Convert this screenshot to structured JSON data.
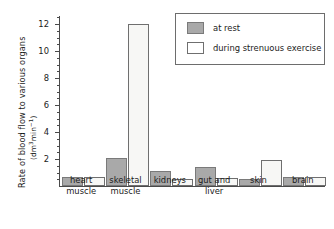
{
  "chart_data": {
    "type": "bar",
    "title": "",
    "xlabel": "",
    "ylabel": "Rate of blood flow to various organs",
    "yunit": "(dm3 min-1)",
    "ylim": [
      0,
      12.6
    ],
    "ytick_values": [
      2,
      4,
      6,
      8,
      10,
      12
    ],
    "ytick_labels": [
      "2",
      "4",
      "6",
      "8",
      "10",
      "12"
    ],
    "yminor_step": 0.5,
    "grid": false,
    "legend_position": "top-right",
    "categories": [
      "heart muscle",
      "skeletal muscle",
      "kidneys",
      "gut and liver",
      "skin",
      "brain"
    ],
    "category_lines": [
      [
        "heart",
        "muscle"
      ],
      [
        "skeletal",
        "muscle"
      ],
      [
        "kidneys",
        ""
      ],
      [
        "gut and",
        "liver"
      ],
      [
        "skin",
        ""
      ],
      [
        "brain",
        ""
      ]
    ],
    "series": [
      {
        "name": "at rest",
        "color": "#a9a9a9",
        "values": [
          0.7,
          2.1,
          1.1,
          1.4,
          0.5,
          0.7
        ]
      },
      {
        "name": "during strenuous exercise",
        "color": "#ffffff",
        "values": [
          0.7,
          12.0,
          0.5,
          0.6,
          1.9,
          0.7
        ]
      }
    ]
  },
  "legend": {
    "items": [
      {
        "label": "at rest",
        "swatch": "gray-swatch"
      },
      {
        "label": "during strenuous exercise",
        "swatch": "white-swatch"
      }
    ]
  },
  "axis": {
    "y_title_main": "Rate of blood flow to various organs",
    "y_unit_prefix": "(dm",
    "y_unit_sup1": "3",
    "y_unit_mid": "min",
    "y_unit_sup2": "−1",
    "y_unit_suffix": ")"
  },
  "colors": {
    "bar_rest": "#a9a9a9",
    "bar_exercise": "#f7f7f5",
    "axis": "#4a4a4a",
    "text": "#1b1b1b",
    "legend_border": "#6d6d6d",
    "background": "#ffffff"
  }
}
